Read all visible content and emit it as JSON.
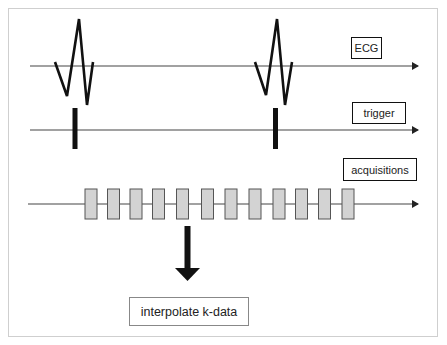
{
  "diagram": {
    "type": "timing-diagram",
    "colors": {
      "line": "#222222",
      "acquisition_fill": "#d3d3d3",
      "acquisition_stroke": "#555555",
      "frame_border": "#cfcfcf"
    },
    "tracks": [
      {
        "id": "ecg",
        "label": "ECG",
        "y": 66
      },
      {
        "id": "trigger",
        "label": "trigger",
        "y": 130
      },
      {
        "id": "acquisitions",
        "label": "acquisitions",
        "y": 204
      }
    ],
    "ecg_complexes": 2,
    "trigger_markers": 2,
    "acquisition_blocks": 12,
    "result": {
      "label": "interpolate k-data"
    }
  }
}
